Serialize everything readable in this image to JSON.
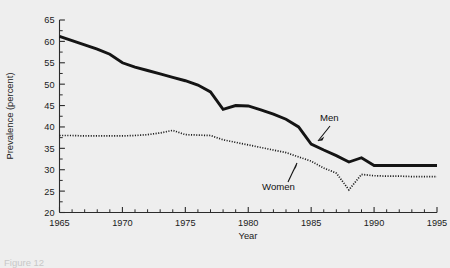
{
  "figure": {
    "caption_partial": "Figure 12",
    "background_color": "#eeeeee",
    "ink_color": "#141414"
  },
  "chart_data": {
    "type": "line",
    "title": "",
    "subtitle": "",
    "xlabel": "Year",
    "ylabel": "Prevalence (percent)",
    "xlim": [
      1965,
      1995
    ],
    "ylim": [
      20,
      65
    ],
    "grid": false,
    "legend_position": "inline-annotations",
    "x_ticks": [
      1965,
      1970,
      1975,
      1980,
      1985,
      1990,
      1995
    ],
    "x_tick_labels": [
      "1965",
      "1970",
      "1975",
      "1980",
      "1985",
      "1990",
      "1995"
    ],
    "x_minor_tick_step": 1,
    "y_ticks": [
      20,
      25,
      30,
      35,
      40,
      45,
      50,
      55,
      60,
      65
    ],
    "y_tick_labels": [
      "20",
      "25",
      "30",
      "35",
      "40",
      "45",
      "50",
      "55",
      "60",
      "65"
    ],
    "y_minor_tick_step": 2.5,
    "x": [
      1965,
      1966,
      1967,
      1968,
      1969,
      1970,
      1971,
      1972,
      1973,
      1974,
      1975,
      1976,
      1977,
      1978,
      1979,
      1980,
      1981,
      1982,
      1983,
      1984,
      1985,
      1986,
      1987,
      1988,
      1989,
      1990,
      1991,
      1992,
      1993,
      1994,
      1995
    ],
    "series": [
      {
        "name": "Men",
        "style": "solid",
        "color": "#141414",
        "annotation_label": "Men",
        "values": [
          61.2,
          60.2,
          59.2,
          58.2,
          57.0,
          55.0,
          54.0,
          53.2,
          52.4,
          51.6,
          50.8,
          49.8,
          48.2,
          44.1,
          45.0,
          44.9,
          44.0,
          43.0,
          41.8,
          40.0,
          36.0,
          34.6,
          33.3,
          31.8,
          32.8,
          31.0,
          31.0,
          31.0,
          31.0,
          31.0,
          31.0
        ]
      },
      {
        "name": "Women",
        "style": "dotted",
        "color": "#1c1c1c",
        "annotation_label": "Women",
        "values": [
          38.0,
          38.0,
          37.9,
          37.9,
          37.9,
          37.9,
          38.0,
          38.2,
          38.6,
          39.2,
          38.2,
          38.1,
          38.0,
          37.0,
          36.4,
          35.8,
          35.2,
          34.6,
          34.0,
          33.0,
          32.0,
          30.4,
          29.2,
          25.3,
          28.9,
          28.6,
          28.5,
          28.5,
          28.4,
          28.4,
          28.4
        ]
      }
    ],
    "annotations": [
      {
        "text": "Men",
        "points_to_year": 1985,
        "points_to_value": 36.0
      },
      {
        "text": "Women",
        "points_to_year": 1984,
        "points_to_value": 33.0
      }
    ]
  }
}
